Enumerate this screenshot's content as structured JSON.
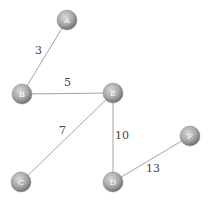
{
  "graph": {
    "type": "weighted-undirected",
    "nodes": [
      {
        "id": "A",
        "label": "A",
        "x": 67,
        "y": 20
      },
      {
        "id": "B",
        "label": "B",
        "x": 22,
        "y": 94
      },
      {
        "id": "E",
        "label": "E",
        "x": 113,
        "y": 93
      },
      {
        "id": "C",
        "label": "C",
        "x": 21,
        "y": 182
      },
      {
        "id": "D",
        "label": "D",
        "x": 113,
        "y": 182
      },
      {
        "id": "F",
        "label": "F",
        "x": 190,
        "y": 136
      }
    ],
    "edges": [
      {
        "from": "A",
        "to": "B",
        "weight": "3",
        "label_x": 35,
        "label_y": 54
      },
      {
        "from": "B",
        "to": "E",
        "weight": "5",
        "label_x": 64,
        "label_y": 86
      },
      {
        "from": "E",
        "to": "C",
        "weight": "7",
        "label_x": 59,
        "label_y": 134
      },
      {
        "from": "E",
        "to": "D",
        "weight": "10",
        "label_x": 115,
        "label_y": 139
      },
      {
        "from": "D",
        "to": "F",
        "weight": "13",
        "label_x": 146,
        "label_y": 172
      }
    ],
    "node_radius": 10,
    "colors": {
      "node_fill_light": "#cfcfcf",
      "node_fill_dark": "#7a7a7a",
      "edge": "#9a9a9a",
      "label": "#444444"
    }
  }
}
